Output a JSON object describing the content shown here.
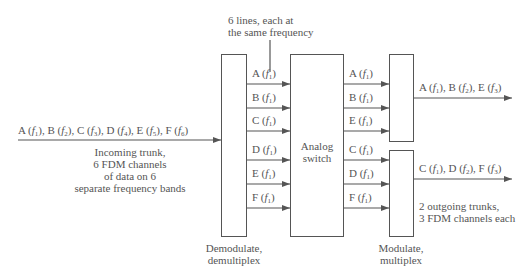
{
  "diagram": {
    "incoming": {
      "signals": "A (f1), B (f2), C (f3), D (f4), E (f5), F (f6)",
      "caption_lines": [
        "Incoming trunk,",
        "6 FDM channels",
        "of data on 6",
        "separate frequency bands"
      ]
    },
    "top_note": [
      "6 lines, each at",
      "the same frequency"
    ],
    "demux": {
      "caption_lines": [
        "Demodulate,",
        "demultiplex"
      ],
      "outputs": [
        "A (f1)",
        "B (f1)",
        "C (f1)",
        "D (f1)",
        "E (f1)",
        "F (f1)"
      ]
    },
    "switch": {
      "label_lines": [
        "Analog",
        "switch"
      ],
      "outputs": [
        "A (f1)",
        "B (f1)",
        "E (f1)",
        "C (f1)",
        "D (f1)",
        "F (f1)"
      ]
    },
    "mux": {
      "caption_lines": [
        "Modulate,",
        "multiplex"
      ],
      "outputs": [
        "A (f1), B (f2), E (f3)",
        "C (f1), D (f2), F (f3)"
      ],
      "note_lines": [
        "2 outgoing trunks,",
        "3 FDM channels each"
      ]
    },
    "colors": {
      "line": "#555555",
      "text": "#555555",
      "background": "#ffffff"
    }
  }
}
